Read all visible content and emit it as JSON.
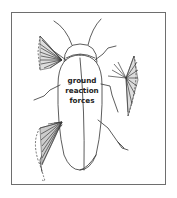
{
  "figure": {
    "label_lines": [
      "ground",
      "reaction",
      "forces"
    ],
    "colors": {
      "outline": "#333333",
      "hatch": "#3a3a3a",
      "frame": "#6e6e6e",
      "background": "#ffffff"
    },
    "force_fans": [
      {
        "leg": "front-left",
        "position": "upper-left"
      },
      {
        "leg": "middle-right",
        "position": "right"
      },
      {
        "leg": "hind-left",
        "position": "lower-left"
      }
    ]
  }
}
